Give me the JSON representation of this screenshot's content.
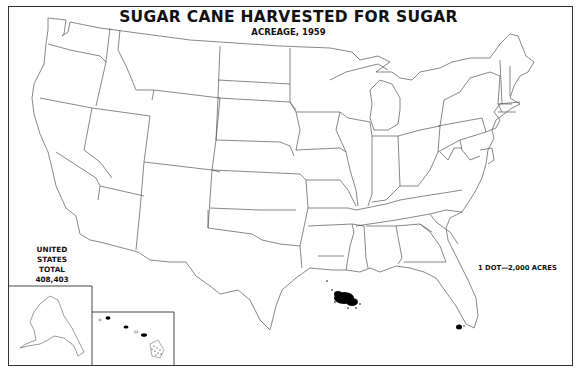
{
  "map": {
    "title": "SUGAR CANE HARVESTED FOR SUGAR",
    "subtitle": "ACREAGE, 1959",
    "total": {
      "line1": "UNITED STATES",
      "line2": "TOTAL",
      "value": "408,403"
    },
    "legend": "1 DOT—2,000 ACRES",
    "insets": [
      "Alaska",
      "Hawaii"
    ],
    "dot_concentrations": [
      "Louisiana",
      "Florida",
      "Hawaii"
    ],
    "colors": {
      "border": "#333333",
      "state_line": "#555555",
      "dots": "#000000",
      "background": "#ffffff"
    }
  }
}
